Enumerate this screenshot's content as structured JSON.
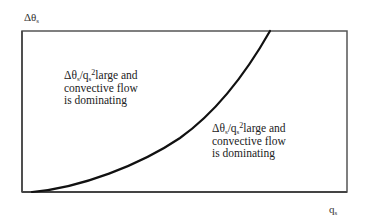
{
  "figure": {
    "y_axis_label": {
      "main": "Δθ",
      "sub": "s"
    },
    "x_axis_label": {
      "main": "q",
      "sub": "s"
    },
    "annotations": [
      {
        "ratio_num": "Δθ",
        "ratio_num_sub": "s",
        "slash": "/",
        "ratio_den": "q",
        "ratio_den_sub": "s",
        "exponent": "2",
        "line1_rest": "large and",
        "line2": "convective flow",
        "line3": "is dominating"
      },
      {
        "ratio_num": "Δθ",
        "ratio_num_sub": "s",
        "slash": "/",
        "ratio_den": "q",
        "ratio_den_sub": "s",
        "exponent": "2",
        "line1_rest": "large and",
        "line2": "convective flow",
        "line3": "is dominating"
      }
    ],
    "colors": {
      "frame": "#555555",
      "curve": "#111111",
      "text": "#222222"
    }
  }
}
